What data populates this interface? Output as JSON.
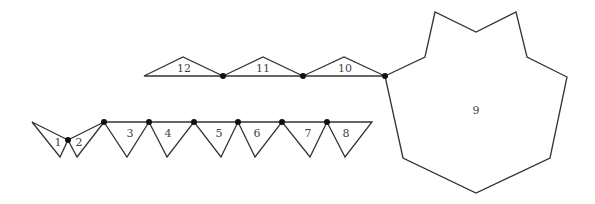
{
  "diagram": {
    "type": "polygon-chain-net",
    "shapes": [
      {
        "label": "1",
        "kind": "triangle"
      },
      {
        "label": "2",
        "kind": "triangle"
      },
      {
        "label": "3",
        "kind": "triangle"
      },
      {
        "label": "4",
        "kind": "triangle"
      },
      {
        "label": "5",
        "kind": "triangle"
      },
      {
        "label": "6",
        "kind": "triangle"
      },
      {
        "label": "7",
        "kind": "triangle"
      },
      {
        "label": "8",
        "kind": "triangle"
      },
      {
        "label": "9",
        "kind": "decagon"
      },
      {
        "label": "10",
        "kind": "triangle"
      },
      {
        "label": "11",
        "kind": "triangle"
      },
      {
        "label": "12",
        "kind": "triangle"
      }
    ],
    "joint_count": 11,
    "stroke_color": "#333333",
    "joint_color": "#111111"
  }
}
